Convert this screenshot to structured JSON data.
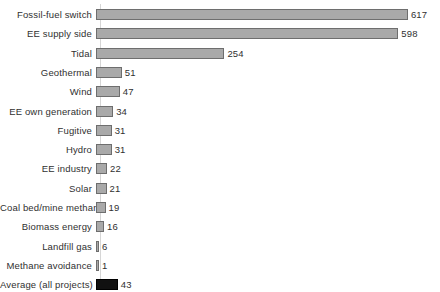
{
  "chart_data": {
    "type": "bar",
    "orientation": "horizontal",
    "title": "",
    "subtitle": "",
    "xlabel": "",
    "ylabel": "",
    "grid": false,
    "legend": "none",
    "xlim": [
      0,
      617
    ],
    "axis_line": true,
    "value_labels": true,
    "categories": [
      "Fossil-fuel switch",
      "EE supply side",
      "Tidal",
      "Geothermal",
      "Wind",
      "EE own generation",
      "Fugitive",
      "Hydro",
      "EE industry",
      "Solar",
      "Coal bed/mine methane",
      "Biomass energy",
      "Landfill gas",
      "Methane avoidance",
      "Average (all projects)"
    ],
    "values": [
      617,
      598,
      254,
      51,
      47,
      34,
      31,
      31,
      22,
      21,
      19,
      16,
      6,
      1,
      43
    ],
    "value_text": [
      "617",
      "598",
      "254",
      "51",
      "47",
      "34",
      "31",
      "31",
      "22",
      "21",
      "19",
      "16",
      "6",
      "1",
      "43"
    ],
    "highlight_index": 14,
    "colors": {
      "bar_fill": "#a9a9a9",
      "bar_border": "#6e6e6e",
      "highlight_fill": "#111111",
      "highlight_border": "#000000",
      "axis_line": "#d6d6d6",
      "text": "#303030",
      "background": "#ffffff"
    }
  }
}
